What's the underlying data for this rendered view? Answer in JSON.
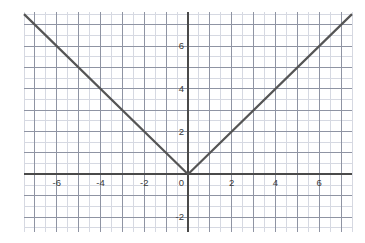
{
  "figure": {
    "name": "absolute-value-graph",
    "background_color": "#ffffff"
  },
  "chart_data": {
    "type": "line",
    "title": "",
    "subtitle": "",
    "xlabel": "",
    "ylabel": "",
    "function": "y = |x|",
    "xlim": [
      -7.5,
      7.5
    ],
    "ylim": [
      -2.7,
      7.6
    ],
    "x_major_tick_step": 2,
    "y_major_tick_step": 2,
    "x_minor_tick_step": 0.5,
    "y_minor_tick_step": 0.5,
    "grid": true,
    "grid_major_color": "#8f94a3",
    "grid_minor_color": "#d6d9e2",
    "axis_color": "#4a4a4a",
    "series": [
      {
        "name": "y = |x|",
        "color": "#555555",
        "line_width": 2.2,
        "x": [
          -7.5,
          0,
          7.5
        ],
        "values": [
          7.5,
          0,
          7.5
        ],
        "points": [
          {
            "x": -7.5,
            "y": 7.5
          },
          {
            "x": -6,
            "y": 6
          },
          {
            "x": -4,
            "y": 4
          },
          {
            "x": -2,
            "y": 2
          },
          {
            "x": 0,
            "y": 0
          },
          {
            "x": 2,
            "y": 2
          },
          {
            "x": 4,
            "y": 4
          },
          {
            "x": 6,
            "y": 6
          },
          {
            "x": 7.5,
            "y": 7.5
          }
        ]
      }
    ],
    "x_tick_labels": [
      {
        "value": -6,
        "text": "-6"
      },
      {
        "value": -4,
        "text": "-4"
      },
      {
        "value": -2,
        "text": "-2"
      },
      {
        "value": 2,
        "text": "2"
      },
      {
        "value": 4,
        "text": "4"
      },
      {
        "value": 6,
        "text": "6"
      }
    ],
    "y_tick_labels": [
      {
        "value": 6,
        "text": "6"
      },
      {
        "value": 4,
        "text": "4"
      },
      {
        "value": 2,
        "text": "2"
      },
      {
        "value": -2,
        "text": "-2"
      }
    ],
    "origin_label": {
      "text": "0",
      "x": 0,
      "y": 0
    },
    "legend": null,
    "legend_position": "none",
    "annotations": []
  }
}
